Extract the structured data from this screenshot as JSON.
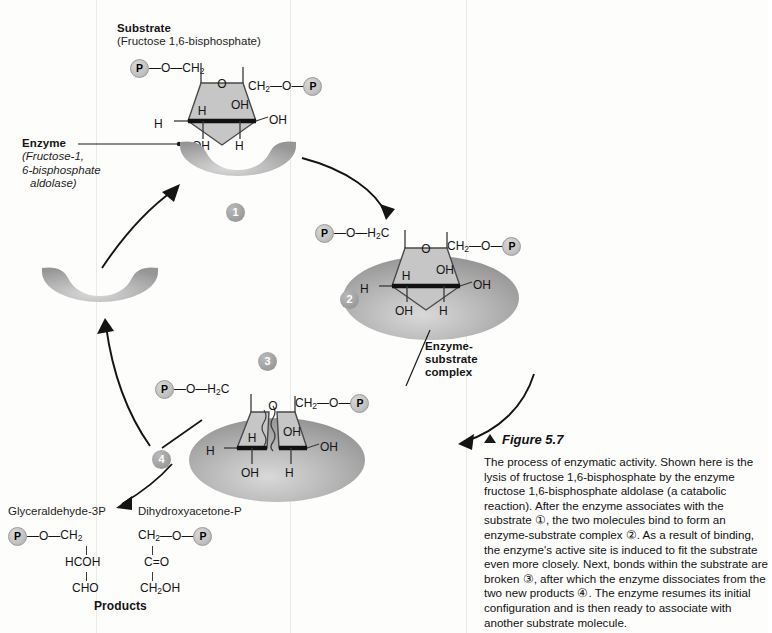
{
  "figure": {
    "marker": "▲",
    "title": "Figure 5.7",
    "caption": "The process of enzymatic activity. Shown here is the lysis of fructose 1,6-bisphosphate by the enzyme fructose 1,6-bisphosphate aldolase (a catabolic reaction). After the enzyme associates with the substrate ①, the two molecules bind to form an enzyme-substrate complex ②. As a result of binding, the enzyme's active site is induced to fit the substrate even more closely. Next, bonds within the substrate are broken ③, after which the enzyme dissociates from the two new products ④. The enzyme resumes its initial configuration and is then ready to associate with another substrate molecule."
  },
  "labels": {
    "substrate_title": "Substrate",
    "substrate_sub": "(Fructose 1,6-bisphosphate)",
    "enzyme_title": "Enzyme",
    "enzyme_sub_line1": "(Fructose-1,",
    "enzyme_sub_line2": "6-bisphosphate",
    "enzyme_sub_line3": "aldolase)",
    "complex_line1": "Enzyme-",
    "complex_line2": "substrate",
    "complex_line3": "complex",
    "products_title": "Products",
    "product_left_name": "Glyceraldehyde-3P",
    "product_right_name": "Dihydroxyacetone-P"
  },
  "steps": [
    {
      "number": "1",
      "name": "step-1-association"
    },
    {
      "number": "2",
      "name": "step-2-binding"
    },
    {
      "number": "3",
      "name": "step-3-bond-breaking"
    },
    {
      "number": "4",
      "name": "step-4-dissociation"
    }
  ],
  "chem": {
    "phosphate_glyph": "P",
    "bond_dash": "—",
    "oxygen": "O",
    "ch2": "CH",
    "ch2_sub": "2",
    "h2c": "H",
    "h2c_sub": "2",
    "h2c_tail": "C",
    "oh": "OH",
    "h": "H",
    "hcoh": "HCOH",
    "cho": "CHO",
    "c_eq_o": "C=O",
    "ch2oh_head": "CH",
    "ch2oh_sub": "2",
    "ch2oh_tail": "OH"
  },
  "ring_atoms": {
    "substrate_top_o": "O",
    "inner_h": "H",
    "inner_oh": "OH",
    "left_h": "H",
    "right_oh": "OH",
    "bottom_oh": "OH",
    "bottom_h": "H"
  },
  "colors": {
    "enzyme_light": "#c9c9c9",
    "enzyme_mid": "#aeaeae",
    "enzyme_dark": "#8f8f8f",
    "ring_fill": "#c7c7c7",
    "badge": "#9c9c9c",
    "ink": "#141414",
    "background": "#fdfdfc"
  }
}
